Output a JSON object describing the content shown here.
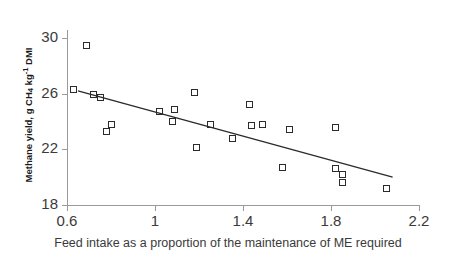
{
  "chart_data": {
    "type": "scatter",
    "title": "",
    "xlabel": "Feed intake as a proportion of the maintenance of ME required",
    "ylabel": "Methane yield, g CH4 kg-1 DMI",
    "ylabel_parts": {
      "prefix": "Methane yield, g CH",
      "sub1": "4",
      "mid": " kg",
      "sup1": "-1",
      "suffix": " DMI"
    },
    "xlim": [
      0.6,
      2.2
    ],
    "ylim": [
      18,
      30
    ],
    "xticks": [
      0.6,
      1,
      1.4,
      1.8,
      2.2
    ],
    "xtick_labels": [
      "0.6",
      "1",
      "1.4",
      "1.8",
      "2.2"
    ],
    "yticks": [
      18,
      22,
      26,
      30
    ],
    "ytick_labels": [
      "18",
      "22",
      "26",
      "30"
    ],
    "grid": false,
    "legend": "none",
    "marker": "open-square",
    "points": [
      {
        "x": 0.69,
        "y": 29.45
      },
      {
        "x": 0.63,
        "y": 26.3
      },
      {
        "x": 0.72,
        "y": 25.95
      },
      {
        "x": 0.75,
        "y": 25.75
      },
      {
        "x": 0.8,
        "y": 23.8
      },
      {
        "x": 0.78,
        "y": 23.3
      },
      {
        "x": 1.02,
        "y": 24.7
      },
      {
        "x": 1.09,
        "y": 24.85
      },
      {
        "x": 1.08,
        "y": 24.0
      },
      {
        "x": 1.18,
        "y": 26.05
      },
      {
        "x": 1.19,
        "y": 22.1
      },
      {
        "x": 1.25,
        "y": 23.8
      },
      {
        "x": 1.35,
        "y": 22.8
      },
      {
        "x": 1.43,
        "y": 25.2
      },
      {
        "x": 1.44,
        "y": 23.7
      },
      {
        "x": 1.49,
        "y": 23.8
      },
      {
        "x": 1.58,
        "y": 20.7
      },
      {
        "x": 1.61,
        "y": 23.4
      },
      {
        "x": 1.82,
        "y": 23.55
      },
      {
        "x": 1.82,
        "y": 20.6
      },
      {
        "x": 1.85,
        "y": 20.2
      },
      {
        "x": 1.85,
        "y": 19.6
      },
      {
        "x": 2.05,
        "y": 19.2
      }
    ],
    "trendline": {
      "x_start": 0.65,
      "y_start": 26.2,
      "x_end": 2.08,
      "y_end": 20.0
    }
  }
}
